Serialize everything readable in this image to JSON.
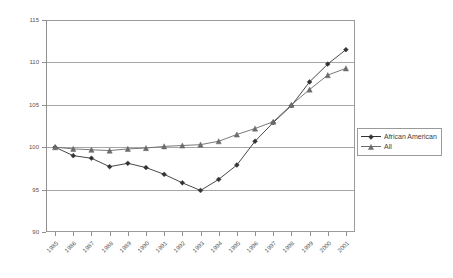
{
  "chart_data": {
    "type": "line",
    "title": "",
    "subtitle": "",
    "xlabel": "",
    "ylabel": "",
    "grid": true,
    "legend_position": "right",
    "xlim": [
      1985,
      2001
    ],
    "ylim": [
      90,
      115
    ],
    "ytick_labels": [
      "115",
      "110",
      "105",
      "100",
      "95",
      "90"
    ],
    "ytick_values": [
      115,
      110,
      105,
      100,
      95,
      90
    ],
    "categories": [
      "1985",
      "1986",
      "1987",
      "1988",
      "1989",
      "1990",
      "1991",
      "1992",
      "1993",
      "1994",
      "1995",
      "1996",
      "1997",
      "1998",
      "1999",
      "2000",
      "2001"
    ],
    "series": [
      {
        "name": "African American",
        "marker": "diamond",
        "color": "#333333",
        "values": [
          100.0,
          99.0,
          98.7,
          97.7,
          98.1,
          97.6,
          96.8,
          95.8,
          94.9,
          96.2,
          97.9,
          100.7,
          102.9,
          104.9,
          107.7,
          109.8,
          111.5
        ]
      },
      {
        "name": "All",
        "marker": "triangle",
        "color": "#6b6b6b",
        "values": [
          100.0,
          99.8,
          99.7,
          99.6,
          99.8,
          99.9,
          100.1,
          100.2,
          100.3,
          100.7,
          101.5,
          102.2,
          103.0,
          105.0,
          106.8,
          108.5,
          109.3
        ]
      }
    ]
  },
  "legend": {
    "items": [
      {
        "label": "African American"
      },
      {
        "label": "All"
      }
    ]
  }
}
